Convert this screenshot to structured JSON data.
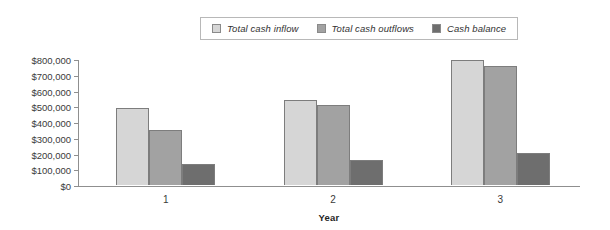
{
  "chart_data": {
    "type": "bar",
    "title": "",
    "xlabel": "Year",
    "ylabel": "",
    "categories": [
      "1",
      "2",
      "3"
    ],
    "series": [
      {
        "name": "Total cash inflow",
        "color": "#d6d6d6",
        "values": [
          490000,
          540000,
          795000
        ]
      },
      {
        "name": "Total cash outflows",
        "color": "#a2a2a2",
        "values": [
          350000,
          510000,
          755000
        ]
      },
      {
        "name": "Cash balance",
        "color": "#6e6e6e",
        "values": [
          135000,
          162000,
          203000
        ]
      }
    ],
    "ylim": [
      0,
      800000
    ],
    "ytick_values": [
      0,
      100000,
      200000,
      300000,
      400000,
      500000,
      600000,
      700000,
      800000
    ],
    "ytick_labels": [
      "$0",
      "$100,000",
      "$200,000",
      "$300,000",
      "$400,000",
      "$500,000",
      "$600,000",
      "$700,000",
      "$800,000"
    ],
    "grid": false,
    "legend_position": "top-center"
  },
  "legend": {
    "items": [
      {
        "label": "Total cash inflow",
        "swatch": "#d6d6d6"
      },
      {
        "label": "Total cash outflows",
        "swatch": "#a2a2a2"
      },
      {
        "label": "Cash balance",
        "swatch": "#6e6e6e"
      }
    ]
  },
  "axes": {
    "x_title": "Year"
  }
}
